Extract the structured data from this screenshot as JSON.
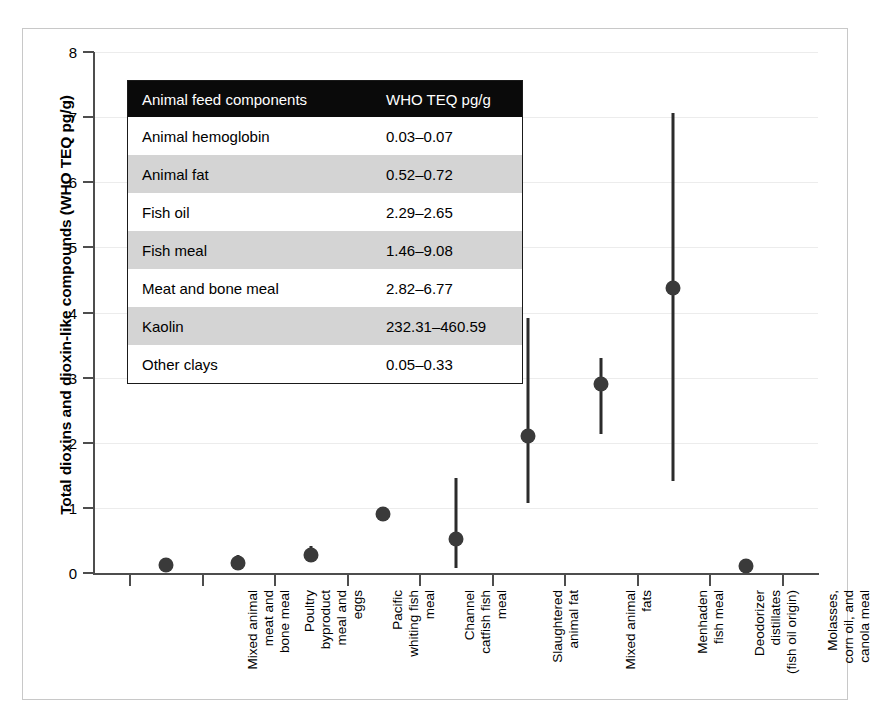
{
  "figure": {
    "y_axis_title": "Total dioxins and dioxin-like compounds (WHO TEQ pg/g)"
  },
  "inset_table": {
    "header": {
      "component_label": "Animal feed components",
      "value_label": "WHO TEQ pg/g"
    },
    "rows": [
      {
        "component": "Animal hemoglobin",
        "value": "0.03–0.07"
      },
      {
        "component": "Animal fat",
        "value": "0.52–0.72"
      },
      {
        "component": "Fish oil",
        "value": "2.29–2.65"
      },
      {
        "component": "Fish meal",
        "value": "1.46–9.08"
      },
      {
        "component": "Meat and bone meal",
        "value": "2.82–6.77"
      },
      {
        "component": "Kaolin",
        "value": "232.31–460.59"
      },
      {
        "component": "Other clays",
        "value": "0.05–0.33"
      }
    ]
  },
  "chart_data": {
    "type": "scatter",
    "title": "",
    "xlabel": "",
    "ylabel": "Total dioxins and dioxin-like compounds (WHO TEQ pg/g)",
    "ylim": [
      0,
      8
    ],
    "yticks": [
      0,
      1,
      2,
      3,
      4,
      5,
      6,
      7,
      8
    ],
    "ytick_labels": [
      "0",
      "1",
      "2",
      "3",
      "4",
      "5",
      "6",
      "7",
      "8"
    ],
    "grid": true,
    "legend": "none",
    "marker_color": "#3a3a3a",
    "errorbar_color": "#2b2b2b",
    "categories": [
      "Mixed animal\nmeat and\nbone meal",
      "Poultry\nbyproduct\nmeal and\neggs",
      "Pacific\nwhiting fish\nmeal",
      "Channel\ncatfish fish\nmeal",
      "Slaughtered\nanimal fat",
      "Mixed animal\nfats",
      "Menhaden\nfish meal",
      "Deodorizer\ndistillates\n(fish oil origin)",
      "Molasses,\ncorn oil, and\ncanola meal"
    ],
    "values": [
      0.13,
      0.15,
      0.28,
      0.9,
      0.52,
      2.1,
      2.9,
      4.38,
      0.1
    ],
    "error_low": [
      0.13,
      0.08,
      0.2,
      0.9,
      0.08,
      1.07,
      2.14,
      1.42,
      0.1
    ],
    "error_high": [
      0.13,
      0.28,
      0.42,
      0.9,
      1.46,
      3.91,
      3.3,
      7.07,
      0.1
    ]
  }
}
